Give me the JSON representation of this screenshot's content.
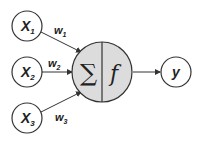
{
  "diagram": {
    "type": "perceptron",
    "inputs": [
      {
        "label": "X",
        "sub": "1",
        "weight": "w",
        "weight_sub": "1"
      },
      {
        "label": "X",
        "sub": "2",
        "weight": "w",
        "weight_sub": "2"
      },
      {
        "label": "X",
        "sub": "3",
        "weight": "w",
        "weight_sub": "3"
      }
    ],
    "neuron": {
      "sum_symbol": "∑",
      "activation": "f",
      "fill": "#dcdcdc"
    },
    "output": {
      "label": "y"
    },
    "colors": {
      "stroke": "#333333",
      "node_fill": "#ffffff",
      "neuron_fill": "#dcdcdc"
    }
  }
}
